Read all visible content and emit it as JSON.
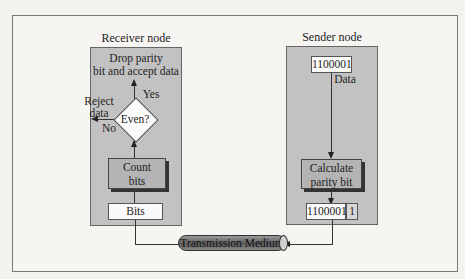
{
  "diagram": {
    "type": "flowchart",
    "receiver": {
      "title": "Receiver node",
      "accept_label_1": "Drop parity",
      "accept_label_2": "bit and accept data",
      "yes_label": "Yes",
      "reject_label_1": "Reject",
      "reject_label_2": "data",
      "no_label": "No",
      "decision": "Even?",
      "count_label_1": "Count",
      "count_label_2": "bits",
      "input_label": "Bits"
    },
    "sender": {
      "title": "Sender node",
      "data_value": "1100001",
      "data_label": "Data",
      "calc_label_1": "Calculate",
      "calc_label_2": "parity bit",
      "output_data": "1100001",
      "output_parity": "1"
    },
    "medium": {
      "label": "Transmission Medium"
    },
    "colors": {
      "node_fill": "#c2c2c2",
      "process_fill": "#b4b4b4",
      "background": "#f6f5f2"
    }
  }
}
